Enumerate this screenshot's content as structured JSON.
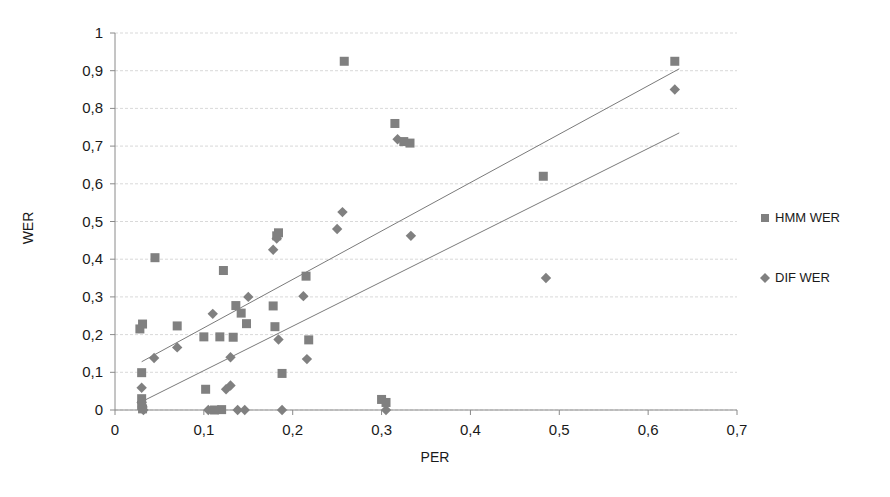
{
  "chart_data": {
    "type": "scatter",
    "title": "",
    "xlabel": "PER",
    "ylabel": "WER",
    "xlim": [
      0,
      0.7
    ],
    "ylim": [
      0,
      1
    ],
    "grid": true,
    "grid_axis": "y",
    "legend_position": "right",
    "decimal_separator": ",",
    "x_ticks": [
      0,
      0.1,
      0.2,
      0.3,
      0.4,
      0.5,
      0.6,
      0.7
    ],
    "x_tick_labels": [
      "0",
      "0,1",
      "0,2",
      "0,3",
      "0,4",
      "0,5",
      "0,6",
      "0,7"
    ],
    "y_ticks": [
      0,
      0.1,
      0.2,
      0.3,
      0.4,
      0.5,
      0.6,
      0.7,
      0.8,
      0.9,
      1
    ],
    "y_tick_labels": [
      "0",
      "0,1",
      "0,2",
      "0,3",
      "0,4",
      "0,5",
      "0,6",
      "0,7",
      "0,8",
      "0,9",
      "1"
    ],
    "marker_color": "#808080",
    "trendline_color": "#7a7a7a",
    "series": [
      {
        "name": "HMM WER",
        "marker": "square",
        "color": "#808080",
        "points": [
          [
            0.028,
            0.215
          ],
          [
            0.031,
            0.228
          ],
          [
            0.03,
            0.099
          ],
          [
            0.03,
            0.03
          ],
          [
            0.03,
            0.012
          ],
          [
            0.031,
            0.003
          ],
          [
            0.07,
            0.223
          ],
          [
            0.1,
            0.194
          ],
          [
            0.102,
            0.055
          ],
          [
            0.112,
            0.0
          ],
          [
            0.118,
            0.194
          ],
          [
            0.12,
            0.001
          ],
          [
            0.133,
            0.193
          ],
          [
            0.136,
            0.277
          ],
          [
            0.142,
            0.257
          ],
          [
            0.148,
            0.229
          ],
          [
            0.178,
            0.276
          ],
          [
            0.18,
            0.221
          ],
          [
            0.182,
            0.462
          ],
          [
            0.184,
            0.47
          ],
          [
            0.188,
            0.097
          ],
          [
            0.215,
            0.355
          ],
          [
            0.218,
            0.186
          ],
          [
            0.122,
            0.37
          ],
          [
            0.045,
            0.404
          ],
          [
            0.258,
            0.925
          ],
          [
            0.3,
            0.028
          ],
          [
            0.305,
            0.02
          ],
          [
            0.315,
            0.76
          ],
          [
            0.325,
            0.712
          ],
          [
            0.332,
            0.708
          ],
          [
            0.482,
            0.62
          ],
          [
            0.63,
            0.925
          ]
        ]
      },
      {
        "name": "DIF WER",
        "marker": "diamond",
        "color": "#808080",
        "points": [
          [
            0.03,
            0.059
          ],
          [
            0.03,
            0.02
          ],
          [
            0.031,
            0.008
          ],
          [
            0.032,
            0.0
          ],
          [
            0.044,
            0.138
          ],
          [
            0.07,
            0.166
          ],
          [
            0.105,
            0.0
          ],
          [
            0.11,
            0.255
          ],
          [
            0.125,
            0.055
          ],
          [
            0.13,
            0.065
          ],
          [
            0.13,
            0.14
          ],
          [
            0.138,
            0.0
          ],
          [
            0.146,
            0.0
          ],
          [
            0.15,
            0.3
          ],
          [
            0.178,
            0.425
          ],
          [
            0.182,
            0.455
          ],
          [
            0.184,
            0.187
          ],
          [
            0.188,
            0.0
          ],
          [
            0.212,
            0.302
          ],
          [
            0.216,
            0.135
          ],
          [
            0.25,
            0.48
          ],
          [
            0.256,
            0.525
          ],
          [
            0.305,
            0.0
          ],
          [
            0.318,
            0.718
          ],
          [
            0.333,
            0.462
          ],
          [
            0.485,
            0.35
          ],
          [
            0.63,
            0.85
          ]
        ]
      }
    ],
    "trendlines": [
      {
        "name": "HMM WER trend",
        "x": [
          0.03,
          0.635
        ],
        "y": [
          0.128,
          0.905
        ]
      },
      {
        "name": "DIF WER trend",
        "x": [
          0.03,
          0.635
        ],
        "y": [
          0.022,
          0.735
        ]
      }
    ]
  },
  "legend": {
    "items": [
      {
        "label": "HMM WER",
        "marker": "square"
      },
      {
        "label": "DIF WER",
        "marker": "diamond"
      }
    ]
  }
}
